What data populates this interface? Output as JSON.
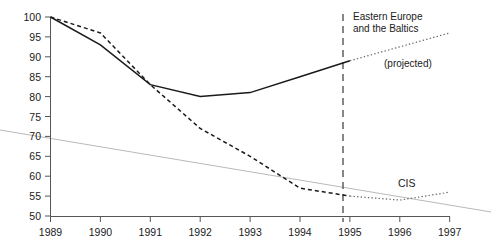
{
  "chart_data": {
    "type": "line",
    "title": "",
    "subtitle": "",
    "xlabel": "",
    "ylabel": "",
    "x": [
      1989,
      1990,
      1991,
      1992,
      1993,
      1994,
      1995,
      1996,
      1997
    ],
    "xticklabels": [
      "1989",
      "1990",
      "1991",
      "1992",
      "1993",
      "1994",
      "1995",
      "1996",
      "1997"
    ],
    "yticks": [
      50,
      55,
      60,
      65,
      70,
      75,
      80,
      85,
      90,
      95,
      100
    ],
    "yticklabels": [
      "50",
      "55",
      "60",
      "65",
      "70",
      "75",
      "80",
      "85",
      "90",
      "95",
      "100"
    ],
    "xlim": [
      1989,
      1997
    ],
    "ylim": [
      50,
      100
    ],
    "grid": false,
    "legend": "inline-annotations",
    "projection_starts": 1995,
    "series": [
      {
        "name": "Eastern Europe and the Baltics",
        "style": "solid",
        "x": [
          1989,
          1990,
          1991,
          1992,
          1993,
          1994,
          1995
        ],
        "values": [
          100,
          93,
          83,
          80,
          81,
          85,
          89
        ]
      },
      {
        "name": "Eastern Europe and the Baltics (projected)",
        "style": "dotted",
        "x": [
          1995,
          1996,
          1997
        ],
        "values": [
          89,
          92.5,
          96
        ]
      },
      {
        "name": "CIS",
        "style": "dashed",
        "x": [
          1989,
          1990,
          1991,
          1992,
          1993,
          1994,
          1995
        ],
        "values": [
          100,
          96,
          83,
          72,
          65,
          57,
          55
        ]
      },
      {
        "name": "CIS (projected)",
        "style": "dotted",
        "x": [
          1995,
          1996,
          1997
        ],
        "values": [
          55,
          54,
          56
        ]
      }
    ],
    "annotations": [
      {
        "id": "eastern-europe-label",
        "text": "Eastern Europe",
        "x": 1997.0,
        "y": 100.5
      },
      {
        "id": "eastern-europe-label-2",
        "text": "and the Baltics",
        "x": 1997.0,
        "y": 97.5
      },
      {
        "id": "projected-label",
        "text": "(projected)",
        "x": 1997.4,
        "y": 88.0
      },
      {
        "id": "cis-label",
        "text": "CIS",
        "x": 1997.0,
        "y": 60.0
      }
    ]
  },
  "labels": {
    "eastern_europe_line1": "Eastern Europe",
    "eastern_europe_line2": "and the Baltics",
    "projected": "(projected)",
    "cis": "CIS"
  },
  "axis": {
    "y": [
      "100",
      "95",
      "90",
      "85",
      "80",
      "75",
      "70",
      "65",
      "60",
      "55",
      "50"
    ],
    "x": [
      "1989",
      "1990",
      "1991",
      "1992",
      "1993",
      "1994",
      "1995",
      "1996",
      "1997"
    ]
  },
  "colors": {
    "ink": "#1a1a1a",
    "axis": "#555555",
    "projection": "#666666",
    "artifact": "#b9b9b9",
    "background": "#ffffff"
  }
}
